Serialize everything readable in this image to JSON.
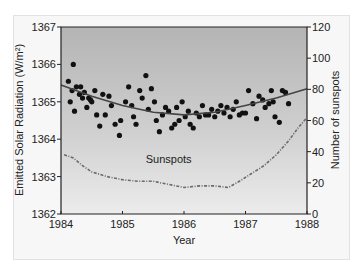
{
  "chart_data": {
    "type": "scatter",
    "title": "",
    "xlabel": "Year",
    "ylabel": "Emitted Solar Radiation (W/m²)",
    "y2label": "Number of sunspots",
    "xlim": [
      1984,
      1988
    ],
    "ylim": [
      1362,
      1367
    ],
    "y2lim": [
      0,
      120
    ],
    "x_ticks": [
      "1984",
      "1985",
      "1986",
      "1987",
      "1988"
    ],
    "y_ticks": [
      "1362",
      "1363",
      "1364",
      "1365",
      "1366",
      "1367"
    ],
    "y2_ticks": [
      "0",
      "20",
      "40",
      "60",
      "80",
      "100",
      "120"
    ],
    "grid": false,
    "legend": null,
    "annotations": [
      {
        "text": "Sunspots",
        "x": 1985.75,
        "y2": 35
      }
    ],
    "series": [
      {
        "name": "Emitted Solar Radiation",
        "axis": "left",
        "kind": "scatter",
        "points": [
          [
            1984.12,
            1365.55
          ],
          [
            1984.15,
            1365.0
          ],
          [
            1984.2,
            1366.0
          ],
          [
            1984.18,
            1365.3
          ],
          [
            1984.25,
            1365.4
          ],
          [
            1984.22,
            1364.75
          ],
          [
            1984.3,
            1365.2
          ],
          [
            1984.32,
            1365.4
          ],
          [
            1984.35,
            1365.1
          ],
          [
            1984.38,
            1365.25
          ],
          [
            1984.42,
            1364.85
          ],
          [
            1984.45,
            1365.1
          ],
          [
            1984.48,
            1365.05
          ],
          [
            1984.5,
            1365.0
          ],
          [
            1984.55,
            1365.3
          ],
          [
            1984.58,
            1364.65
          ],
          [
            1984.63,
            1364.35
          ],
          [
            1984.68,
            1365.2
          ],
          [
            1984.72,
            1364.65
          ],
          [
            1984.78,
            1365.15
          ],
          [
            1984.82,
            1364.9
          ],
          [
            1984.88,
            1364.4
          ],
          [
            1984.95,
            1364.1
          ],
          [
            1984.97,
            1364.5
          ],
          [
            1985.05,
            1365.0
          ],
          [
            1985.1,
            1365.4
          ],
          [
            1985.15,
            1364.9
          ],
          [
            1985.18,
            1364.6
          ],
          [
            1985.22,
            1364.4
          ],
          [
            1985.28,
            1365.3
          ],
          [
            1985.32,
            1365.1
          ],
          [
            1985.38,
            1365.7
          ],
          [
            1985.42,
            1364.8
          ],
          [
            1985.47,
            1365.35
          ],
          [
            1985.52,
            1365.0
          ],
          [
            1985.55,
            1364.5
          ],
          [
            1985.6,
            1364.2
          ],
          [
            1985.65,
            1364.65
          ],
          [
            1985.7,
            1364.85
          ],
          [
            1985.75,
            1364.75
          ],
          [
            1985.8,
            1364.3
          ],
          [
            1985.85,
            1364.4
          ],
          [
            1985.88,
            1364.85
          ],
          [
            1985.92,
            1364.5
          ],
          [
            1985.97,
            1365.0
          ],
          [
            1986.02,
            1364.6
          ],
          [
            1986.07,
            1364.75
          ],
          [
            1986.1,
            1364.4
          ],
          [
            1986.15,
            1364.3
          ],
          [
            1986.2,
            1364.7
          ],
          [
            1986.25,
            1364.6
          ],
          [
            1986.3,
            1364.9
          ],
          [
            1986.35,
            1364.65
          ],
          [
            1986.4,
            1364.65
          ],
          [
            1986.45,
            1364.8
          ],
          [
            1986.5,
            1364.6
          ],
          [
            1986.55,
            1364.75
          ],
          [
            1986.6,
            1364.9
          ],
          [
            1986.65,
            1364.7
          ],
          [
            1986.7,
            1364.85
          ],
          [
            1986.75,
            1364.6
          ],
          [
            1986.8,
            1364.8
          ],
          [
            1986.85,
            1365.0
          ],
          [
            1986.9,
            1364.65
          ],
          [
            1986.95,
            1364.7
          ],
          [
            1987.0,
            1364.7
          ],
          [
            1987.05,
            1365.3
          ],
          [
            1987.12,
            1364.95
          ],
          [
            1987.18,
            1364.55
          ],
          [
            1987.22,
            1365.15
          ],
          [
            1987.28,
            1365.05
          ],
          [
            1987.32,
            1364.85
          ],
          [
            1987.38,
            1364.95
          ],
          [
            1987.42,
            1365.3
          ],
          [
            1987.45,
            1365.0
          ],
          [
            1987.48,
            1364.6
          ],
          [
            1987.55,
            1364.45
          ],
          [
            1987.6,
            1365.3
          ],
          [
            1987.65,
            1365.25
          ],
          [
            1987.7,
            1364.95
          ]
        ]
      },
      {
        "name": "Solar radiation trend",
        "axis": "left",
        "kind": "line",
        "points": [
          [
            1984.0,
            1365.45
          ],
          [
            1984.5,
            1365.15
          ],
          [
            1985.0,
            1364.9
          ],
          [
            1985.5,
            1364.72
          ],
          [
            1986.0,
            1364.65
          ],
          [
            1986.5,
            1364.72
          ],
          [
            1987.0,
            1364.9
          ],
          [
            1987.5,
            1365.1
          ],
          [
            1988.0,
            1365.35
          ]
        ]
      },
      {
        "name": "Sunspots",
        "axis": "right",
        "kind": "line-dashed",
        "points": [
          [
            1984.05,
            38
          ],
          [
            1984.2,
            36
          ],
          [
            1984.35,
            31
          ],
          [
            1984.5,
            27
          ],
          [
            1984.75,
            24
          ],
          [
            1985.0,
            22
          ],
          [
            1985.25,
            21
          ],
          [
            1985.5,
            21
          ],
          [
            1985.75,
            19
          ],
          [
            1986.0,
            17
          ],
          [
            1986.25,
            18
          ],
          [
            1986.5,
            18
          ],
          [
            1986.72,
            17
          ],
          [
            1986.9,
            21
          ],
          [
            1987.1,
            26
          ],
          [
            1987.3,
            31
          ],
          [
            1987.5,
            38
          ],
          [
            1987.7,
            47
          ],
          [
            1987.85,
            55
          ],
          [
            1987.98,
            61
          ]
        ]
      }
    ]
  }
}
